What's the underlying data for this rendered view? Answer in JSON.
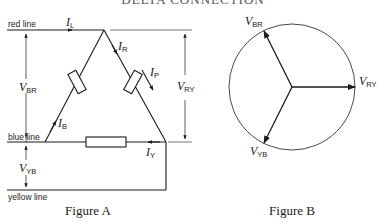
{
  "title": "DELTA CONNECTION",
  "figure_a": {
    "caption": "Figure A",
    "lines": {
      "red": "red line",
      "blue": "blue line",
      "yellow": "yellow line"
    },
    "currents": {
      "line": {
        "symbol": "I",
        "sub": "L"
      },
      "red": {
        "symbol": "I",
        "sub": "R"
      },
      "phase": {
        "symbol": "I",
        "sub": "P"
      },
      "blue": {
        "symbol": "I",
        "sub": "B"
      },
      "yellow": {
        "symbol": "I",
        "sub": "Y"
      }
    },
    "voltages": {
      "br": {
        "symbol": "V",
        "sub": "BR"
      },
      "ry": {
        "symbol": "V",
        "sub": "RY"
      },
      "yb": {
        "symbol": "V",
        "sub": "YB"
      }
    }
  },
  "figure_b": {
    "caption": "Figure B",
    "phasors": [
      {
        "symbol": "V",
        "sub": "BR",
        "angle_deg": 120
      },
      {
        "symbol": "V",
        "sub": "RY",
        "angle_deg": 0
      },
      {
        "symbol": "V",
        "sub": "YB",
        "angle_deg": 240
      }
    ]
  }
}
